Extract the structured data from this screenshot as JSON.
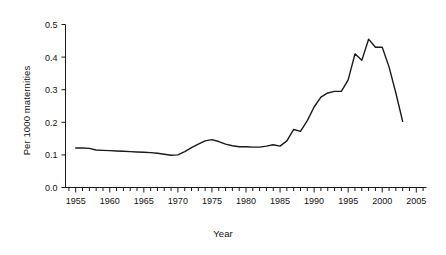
{
  "chart_data": {
    "type": "line",
    "title": "",
    "xlabel": "Year",
    "ylabel": "Per 1000 maternities",
    "xlim": [
      1953.5,
      2006.5
    ],
    "ylim": [
      0.0,
      0.5
    ],
    "grid": false,
    "legend": "none",
    "x_ticks": [
      1955,
      1960,
      1965,
      1970,
      1975,
      1980,
      1985,
      1990,
      1995,
      2000,
      2005
    ],
    "x_tick_labels": [
      "1955",
      "1960",
      "1965",
      "1970",
      "1975",
      "1980",
      "1985",
      "1990",
      "1995",
      "2000",
      "2005"
    ],
    "x_minor_tick_step": 1,
    "y_ticks": [
      0.0,
      0.1,
      0.2,
      0.3,
      0.4,
      0.5
    ],
    "y_tick_labels": [
      "0.0",
      "0.1",
      "0.2",
      "0.3",
      "0.4",
      "0.5"
    ],
    "series": [
      {
        "name": "Rate per 1000 maternities",
        "color": "#1a1a1a",
        "x": [
          1955,
          1956,
          1957,
          1958,
          1959,
          1960,
          1961,
          1962,
          1963,
          1964,
          1965,
          1966,
          1967,
          1968,
          1969,
          1970,
          1971,
          1972,
          1973,
          1974,
          1975,
          1976,
          1977,
          1978,
          1979,
          1980,
          1981,
          1982,
          1983,
          1984,
          1985,
          1986,
          1987,
          1988,
          1989,
          1990,
          1991,
          1992,
          1993,
          1994,
          1995,
          1996,
          1997,
          1998,
          1999,
          2000,
          2001,
          2002,
          2003
        ],
        "y": [
          0.121,
          0.121,
          0.12,
          0.115,
          0.114,
          0.113,
          0.112,
          0.111,
          0.11,
          0.109,
          0.108,
          0.107,
          0.105,
          0.102,
          0.099,
          0.1,
          0.11,
          0.122,
          0.133,
          0.143,
          0.147,
          0.141,
          0.133,
          0.128,
          0.125,
          0.125,
          0.124,
          0.124,
          0.127,
          0.131,
          0.127,
          0.143,
          0.178,
          0.172,
          0.205,
          0.247,
          0.277,
          0.29,
          0.295,
          0.295,
          0.33,
          0.41,
          0.39,
          0.455,
          0.43,
          0.43,
          0.37,
          0.29,
          0.203
        ]
      }
    ]
  },
  "axes": {
    "x_title": "Year",
    "y_title": "Per 1000 maternities"
  }
}
